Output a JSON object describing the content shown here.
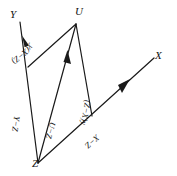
{
  "figure": {
    "type": "vector-parallelogram-diagram",
    "background_color": "#ffffff",
    "stroke_color": "#1a1a1a",
    "vertices": [
      {
        "name": "Y",
        "label": "Y",
        "x": 16,
        "y": 16
      },
      {
        "name": "U",
        "label": "U",
        "x": 78,
        "y": 13
      },
      {
        "name": "X",
        "label": "X",
        "x": 158,
        "y": 57
      },
      {
        "name": "Z",
        "label": "Z",
        "x": 38,
        "y": 165
      }
    ],
    "edges": [
      {
        "name": "z-to-y-ray",
        "from": "Z",
        "to": "Y",
        "arrow": true,
        "arrow_at": 0.78
      },
      {
        "name": "z-to-x-ray",
        "from": "Z",
        "to": "X",
        "arrow": true,
        "arrow_at": 0.72
      },
      {
        "name": "z-to-u-diagonal",
        "from": "Z",
        "to": "U",
        "arrow": true,
        "arrow_at": 0.74
      },
      {
        "name": "y-side-to-u",
        "from": "Y-side",
        "to": "U",
        "arrow": false
      },
      {
        "name": "u-to-x-side",
        "from": "U",
        "to": "X-side",
        "arrow": false
      }
    ],
    "segment_labels": [
      {
        "name": "label-y-x-minus-z",
        "text": "y(X−Z)",
        "x": 32,
        "y": 42,
        "rotation": -18
      },
      {
        "name": "label-y-minus-z",
        "text": "Y−Z",
        "x": 17,
        "y": 110,
        "rotation": -78
      },
      {
        "name": "label-u-minus-z",
        "text": "U−Z",
        "x": 51,
        "y": 116,
        "rotation": -68
      },
      {
        "name": "label-z-minus-x-y",
        "text": "(Z−X)y",
        "x": 86,
        "y": 95,
        "rotation": -78
      },
      {
        "name": "label-x-minus-z",
        "text": "X−Z",
        "x": 96,
        "y": 130,
        "rotation": -26
      }
    ]
  }
}
